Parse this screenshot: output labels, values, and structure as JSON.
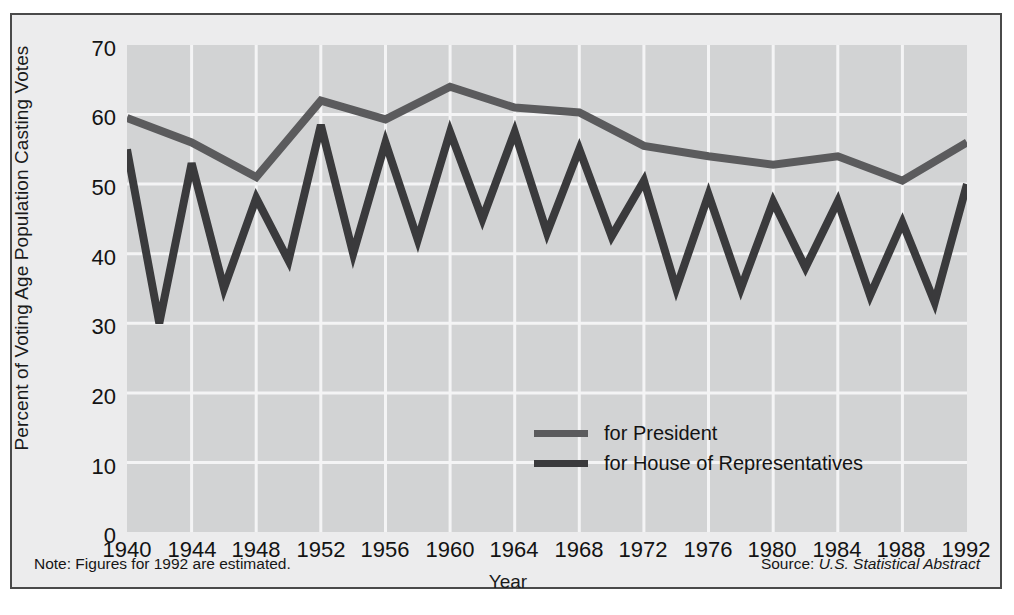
{
  "figure": {
    "note": "Note: Figures for 1992 are estimated.",
    "source_prefix": "Source: ",
    "source_name": "U.S. Statistical Abstract"
  },
  "colors": {
    "president_line": "#5b5b5d",
    "house_line": "#3a3a3c",
    "plot_background": "#d2d3d4",
    "figure_background": "#ececed",
    "frame_border": "#4a4a4a",
    "gridline": "#f4f4f5",
    "text": "#131313"
  },
  "legend": {
    "position": "inside-center-right",
    "entries": [
      {
        "label": "for President",
        "color": "#5b5b5d"
      },
      {
        "label": "for House of Representatives",
        "color": "#3a3a3c"
      }
    ]
  },
  "chart_data": {
    "type": "line",
    "title": "",
    "subtitle": "",
    "xlabel": "Year",
    "ylabel": "Percent of Voting Age Population Casting Votes",
    "xlim": [
      1940,
      1992
    ],
    "ylim": [
      0,
      70
    ],
    "ytick_labels": [
      "0",
      "10",
      "20",
      "30",
      "40",
      "50",
      "60",
      "70"
    ],
    "ytick_values": [
      0,
      10,
      20,
      30,
      40,
      50,
      60,
      70
    ],
    "xtick_labels": [
      "1940",
      "1944",
      "1948",
      "1952",
      "1956",
      "1960",
      "1964",
      "1968",
      "1972",
      "1976",
      "1980",
      "1984",
      "1988",
      "1992"
    ],
    "xtick_values": [
      1940,
      1944,
      1948,
      1952,
      1956,
      1960,
      1964,
      1968,
      1972,
      1976,
      1980,
      1984,
      1988,
      1992
    ],
    "grid": "both",
    "series": [
      {
        "name": "for President",
        "color": "#5b5b5d",
        "x": [
          1940,
          1944,
          1948,
          1952,
          1956,
          1960,
          1964,
          1968,
          1972,
          1976,
          1980,
          1984,
          1988,
          1992
        ],
        "values": [
          59.5,
          56.0,
          51.0,
          62.0,
          59.3,
          64.0,
          61.0,
          60.3,
          55.5,
          54.0,
          52.8,
          54.0,
          50.5,
          56.0
        ]
      },
      {
        "name": "for House of Representatives",
        "color": "#3a3a3c",
        "x": [
          1940,
          1942,
          1944,
          1946,
          1948,
          1950,
          1952,
          1954,
          1956,
          1958,
          1960,
          1962,
          1964,
          1966,
          1968,
          1970,
          1972,
          1974,
          1976,
          1978,
          1980,
          1982,
          1984,
          1986,
          1988,
          1990,
          1992
        ],
        "values": [
          55.0,
          30.0,
          53.0,
          35.0,
          48.0,
          39.0,
          58.5,
          40.0,
          56.0,
          42.0,
          57.5,
          45.0,
          57.5,
          43.0,
          55.0,
          42.5,
          50.5,
          35.0,
          48.5,
          35.0,
          47.5,
          38.0,
          47.5,
          34.0,
          44.5,
          33.0,
          50.0
        ]
      }
    ]
  }
}
